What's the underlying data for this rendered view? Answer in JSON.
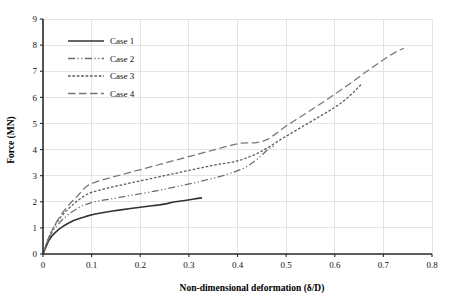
{
  "chart_data": {
    "type": "line",
    "title": "",
    "xlabel": "Non-dimensional deformation (δ/D)",
    "ylabel": "Force (MN)",
    "xlim": [
      0,
      0.8
    ],
    "ylim": [
      0,
      9
    ],
    "xticks": [
      "0",
      "0.1",
      "0.2",
      "0.3",
      "0.4",
      "0.5",
      "0.6",
      "0.7",
      "0.8"
    ],
    "xtick_values": [
      0,
      0.1,
      0.2,
      0.3,
      0.4,
      0.5,
      0.6,
      0.7,
      0.8
    ],
    "yticks": [
      "0",
      "1",
      "2",
      "3",
      "4",
      "5",
      "6",
      "7",
      "8",
      "9"
    ],
    "ytick_values": [
      0,
      1,
      2,
      3,
      4,
      5,
      6,
      7,
      8,
      9
    ],
    "grid": true,
    "legend_position": "top-left-inside",
    "series": [
      {
        "name": "Case 1",
        "style": "solid",
        "color": "#333333",
        "points": [
          [
            0.0,
            0.0
          ],
          [
            0.004,
            0.18
          ],
          [
            0.008,
            0.36
          ],
          [
            0.012,
            0.52
          ],
          [
            0.018,
            0.68
          ],
          [
            0.025,
            0.82
          ],
          [
            0.033,
            0.95
          ],
          [
            0.042,
            1.07
          ],
          [
            0.052,
            1.18
          ],
          [
            0.063,
            1.28
          ],
          [
            0.075,
            1.36
          ],
          [
            0.09,
            1.45
          ],
          [
            0.105,
            1.52
          ],
          [
            0.122,
            1.58
          ],
          [
            0.14,
            1.64
          ],
          [
            0.16,
            1.69
          ],
          [
            0.18,
            1.74
          ],
          [
            0.2,
            1.79
          ],
          [
            0.22,
            1.84
          ],
          [
            0.24,
            1.88
          ],
          [
            0.255,
            1.93
          ],
          [
            0.268,
            1.99
          ],
          [
            0.28,
            2.02
          ],
          [
            0.295,
            2.06
          ],
          [
            0.308,
            2.1
          ],
          [
            0.318,
            2.13
          ],
          [
            0.327,
            2.15
          ]
        ]
      },
      {
        "name": "Case 2",
        "style": "dash-dot-dot",
        "color": "#6b6b6b",
        "points": [
          [
            0.0,
            0.0
          ],
          [
            0.005,
            0.26
          ],
          [
            0.01,
            0.52
          ],
          [
            0.016,
            0.74
          ],
          [
            0.023,
            0.95
          ],
          [
            0.031,
            1.14
          ],
          [
            0.04,
            1.32
          ],
          [
            0.05,
            1.48
          ],
          [
            0.06,
            1.62
          ],
          [
            0.072,
            1.76
          ],
          [
            0.085,
            1.88
          ],
          [
            0.1,
            1.97
          ],
          [
            0.115,
            2.03
          ],
          [
            0.13,
            2.08
          ],
          [
            0.15,
            2.14
          ],
          [
            0.17,
            2.21
          ],
          [
            0.19,
            2.27
          ],
          [
            0.21,
            2.34
          ],
          [
            0.23,
            2.41
          ],
          [
            0.25,
            2.48
          ],
          [
            0.27,
            2.56
          ],
          [
            0.29,
            2.64
          ],
          [
            0.31,
            2.72
          ],
          [
            0.33,
            2.81
          ],
          [
            0.35,
            2.9
          ],
          [
            0.37,
            3.0
          ],
          [
            0.39,
            3.12
          ],
          [
            0.41,
            3.26
          ],
          [
            0.425,
            3.42
          ],
          [
            0.44,
            3.62
          ],
          [
            0.452,
            3.82
          ],
          [
            0.462,
            4.0
          ],
          [
            0.47,
            4.1
          ],
          [
            0.478,
            4.14
          ]
        ]
      },
      {
        "name": "Case 3",
        "style": "dotted",
        "color": "#5a5a5a",
        "points": [
          [
            0.0,
            0.0
          ],
          [
            0.005,
            0.3
          ],
          [
            0.011,
            0.6
          ],
          [
            0.018,
            0.88
          ],
          [
            0.026,
            1.14
          ],
          [
            0.035,
            1.38
          ],
          [
            0.045,
            1.6
          ],
          [
            0.056,
            1.8
          ],
          [
            0.067,
            1.98
          ],
          [
            0.078,
            2.14
          ],
          [
            0.09,
            2.28
          ],
          [
            0.1,
            2.36
          ],
          [
            0.115,
            2.44
          ],
          [
            0.13,
            2.51
          ],
          [
            0.15,
            2.6
          ],
          [
            0.17,
            2.68
          ],
          [
            0.19,
            2.76
          ],
          [
            0.21,
            2.84
          ],
          [
            0.23,
            2.92
          ],
          [
            0.25,
            3.0
          ],
          [
            0.27,
            3.08
          ],
          [
            0.29,
            3.16
          ],
          [
            0.31,
            3.24
          ],
          [
            0.33,
            3.32
          ],
          [
            0.35,
            3.4
          ],
          [
            0.37,
            3.46
          ],
          [
            0.39,
            3.52
          ],
          [
            0.41,
            3.62
          ],
          [
            0.43,
            3.76
          ],
          [
            0.45,
            3.94
          ],
          [
            0.47,
            4.16
          ],
          [
            0.49,
            4.4
          ],
          [
            0.51,
            4.62
          ],
          [
            0.53,
            4.84
          ],
          [
            0.55,
            5.06
          ],
          [
            0.57,
            5.28
          ],
          [
            0.59,
            5.5
          ],
          [
            0.61,
            5.74
          ],
          [
            0.625,
            5.96
          ],
          [
            0.638,
            6.18
          ],
          [
            0.648,
            6.38
          ],
          [
            0.655,
            6.5
          ]
        ]
      },
      {
        "name": "Case 4",
        "style": "long-dash",
        "color": "#767676",
        "points": [
          [
            0.0,
            0.0
          ],
          [
            0.006,
            0.34
          ],
          [
            0.013,
            0.68
          ],
          [
            0.021,
            1.0
          ],
          [
            0.03,
            1.3
          ],
          [
            0.04,
            1.58
          ],
          [
            0.051,
            1.84
          ],
          [
            0.062,
            2.06
          ],
          [
            0.072,
            2.24
          ],
          [
            0.082,
            2.46
          ],
          [
            0.09,
            2.6
          ],
          [
            0.1,
            2.7
          ],
          [
            0.115,
            2.8
          ],
          [
            0.13,
            2.88
          ],
          [
            0.15,
            2.98
          ],
          [
            0.17,
            3.08
          ],
          [
            0.19,
            3.18
          ],
          [
            0.21,
            3.28
          ],
          [
            0.23,
            3.38
          ],
          [
            0.25,
            3.48
          ],
          [
            0.27,
            3.58
          ],
          [
            0.29,
            3.68
          ],
          [
            0.31,
            3.78
          ],
          [
            0.33,
            3.88
          ],
          [
            0.35,
            3.98
          ],
          [
            0.37,
            4.08
          ],
          [
            0.39,
            4.18
          ],
          [
            0.405,
            4.24
          ],
          [
            0.42,
            4.26
          ],
          [
            0.435,
            4.26
          ],
          [
            0.45,
            4.3
          ],
          [
            0.465,
            4.42
          ],
          [
            0.48,
            4.62
          ],
          [
            0.5,
            4.9
          ],
          [
            0.52,
            5.14
          ],
          [
            0.54,
            5.38
          ],
          [
            0.56,
            5.62
          ],
          [
            0.58,
            5.86
          ],
          [
            0.6,
            6.12
          ],
          [
            0.62,
            6.38
          ],
          [
            0.64,
            6.64
          ],
          [
            0.66,
            6.92
          ],
          [
            0.68,
            7.18
          ],
          [
            0.7,
            7.44
          ],
          [
            0.715,
            7.62
          ],
          [
            0.73,
            7.78
          ],
          [
            0.742,
            7.88
          ]
        ]
      }
    ]
  },
  "legend": {
    "items": [
      {
        "label": "Case 1"
      },
      {
        "label": "Case 2"
      },
      {
        "label": "Case 3"
      },
      {
        "label": "Case 4"
      }
    ]
  }
}
